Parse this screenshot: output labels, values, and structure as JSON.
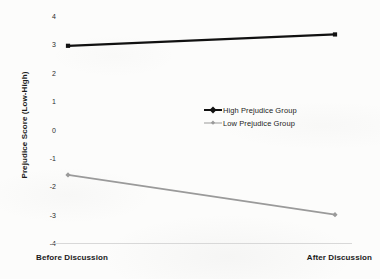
{
  "chart_data": {
    "type": "line",
    "title": "",
    "xlabel": "",
    "ylabel": "Prejudice Score (Low-High)",
    "categories": [
      "Before Discussion",
      "After Discussion"
    ],
    "ylim": [
      -4,
      4
    ],
    "yticks": [
      "4",
      "3",
      "2",
      "1",
      "0",
      "-1",
      "-2",
      "-3",
      "-4"
    ],
    "ytick_values": [
      4,
      3,
      2,
      1,
      0,
      -1,
      -2,
      -3,
      -4
    ],
    "grid": false,
    "legend_position": "center-right",
    "series": [
      {
        "name": "High Prejudice Group",
        "values": [
          2.95,
          3.35
        ],
        "color": "#111111",
        "marker": "square",
        "line_width": 2.2
      },
      {
        "name": "Low Prejudice Group",
        "values": [
          -1.6,
          -3.0
        ],
        "color": "#9a9a9a",
        "marker": "diamond",
        "line_width": 1.6
      }
    ]
  },
  "axis": {
    "y_title": "Prejudice Score (Low-High)",
    "x_tick_left": "Before Discussion",
    "x_tick_right": "After Discussion",
    "y_tick_labels": [
      "4",
      "3",
      "2",
      "1",
      "0",
      "-1",
      "-2",
      "-3",
      "-4"
    ]
  },
  "legend": {
    "items": [
      {
        "label": "High Prejudice Group",
        "color": "#111111"
      },
      {
        "label": "Low Prejudice Group",
        "color": "#9a9a9a"
      }
    ]
  }
}
